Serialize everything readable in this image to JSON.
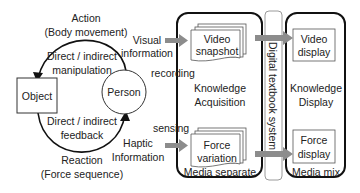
{
  "left_cycle": {
    "action_label": "Action",
    "action_sub": "(Body movement)",
    "manipulation_line1": "Direct / indirect",
    "manipulation_line2": "manipulation",
    "object_label": "Object",
    "person_label": "Person",
    "feedback_line1": "Direct / indirect",
    "feedback_line2": "feedback",
    "reaction_label": "Reaction",
    "reaction_sub": "(Force sequence)"
  },
  "inputs": {
    "visual_line1": "Visual",
    "visual_line2": "information",
    "recording": "recording",
    "sensing": "sensing",
    "haptic_line1": "Haptic",
    "haptic_line2": "Information"
  },
  "media_separate": {
    "video_line1": "Video",
    "video_line2": "snapshot",
    "center_line1": "Knowledge",
    "center_line2": "Acquisition",
    "force_line1": "Force",
    "force_line2": "variation",
    "footer": "Media separate"
  },
  "system_bar": {
    "label": "Digital textbook system"
  },
  "media_mix": {
    "video_line1": "Video",
    "video_line2": "display",
    "center_line1": "Knowledge",
    "center_line2": "Display",
    "force_line1": "Force",
    "force_line2": "display",
    "footer": "Media mix"
  },
  "colors": {
    "arrow_fill": "#8c8c8c",
    "stroke": "#111111",
    "bar_stroke": "#9a9a9a"
  }
}
